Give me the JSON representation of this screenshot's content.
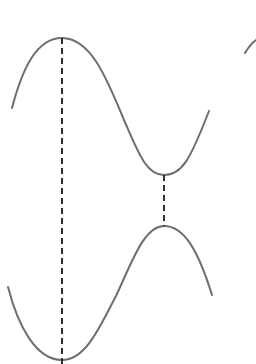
{
  "diagram": {
    "canvas": {
      "width": 256,
      "height": 364,
      "background": "#ffffff"
    },
    "style": {
      "curve_color": "#6e6e6e",
      "curve_width": 2,
      "dash_color": "#2e2e2e",
      "dash_width": 2,
      "dash_pattern": "6 4"
    },
    "curves": [
      {
        "id": "upper-wave",
        "description": "sinusoidal curve with maximum at left and minimum at right",
        "path": "M 12 108 C 22 70, 36 38, 62 38 C 90 38, 106 76, 124 120 C 138 152, 146 175, 164 175 C 182 175, 190 160, 209 111"
      },
      {
        "id": "lower-wave",
        "description": "sinusoidal curve (mirrored) with minimum at left and maximum at right",
        "path": "M 8 287 C 18 326, 36 360, 62 360 C 86 360, 100 326, 116 296 C 132 262, 144 226, 164 226 C 184 226, 198 250, 212 295"
      },
      {
        "id": "edge-fragment",
        "description": "partial curve cut off at right edge",
        "path": "M 245 53 C 248 48, 252 43, 256 40"
      }
    ],
    "dashed_lines": [
      {
        "id": "left-vertical",
        "x1": 62,
        "y1": 38,
        "x2": 62,
        "y2": 364
      },
      {
        "id": "center-vertical",
        "x1": 164,
        "y1": 175,
        "x2": 164,
        "y2": 226
      }
    ]
  }
}
